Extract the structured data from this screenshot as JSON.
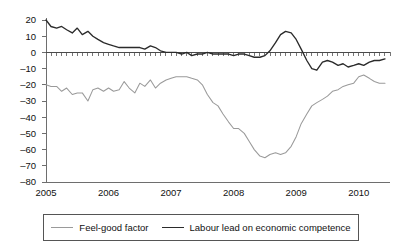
{
  "chart_data": {
    "type": "line",
    "title": "",
    "xlabel": "",
    "ylabel": "",
    "ylim": [
      -80,
      20
    ],
    "xlim": [
      2005.0,
      2010.5
    ],
    "grid": false,
    "legend_position": "bottom",
    "y_ticks": [
      20,
      10,
      0,
      -10,
      -20,
      -30,
      -40,
      -50,
      -60,
      -70,
      -80
    ],
    "y_tick_labels": [
      "20",
      "10",
      "0",
      "–10",
      "–20",
      "–30",
      "–40",
      "–50",
      "–60",
      "–70",
      "–80"
    ],
    "x_ticks": [
      2005,
      2006,
      2007,
      2008,
      2009,
      2010
    ],
    "x_tick_labels": [
      "2005",
      "2006",
      "2007",
      "2008",
      "2009",
      "2010"
    ],
    "minor_x_ticks_per_year": 12,
    "series": [
      {
        "name": "Feel-good factor",
        "color": "#9a9a9a",
        "x": [
          2005.0,
          2005.08,
          2005.17,
          2005.25,
          2005.33,
          2005.42,
          2005.5,
          2005.58,
          2005.67,
          2005.75,
          2005.83,
          2005.92,
          2006.0,
          2006.08,
          2006.17,
          2006.25,
          2006.33,
          2006.42,
          2006.5,
          2006.58,
          2006.67,
          2006.75,
          2006.83,
          2006.92,
          2007.0,
          2007.08,
          2007.17,
          2007.25,
          2007.33,
          2007.42,
          2007.5,
          2007.58,
          2007.67,
          2007.75,
          2007.83,
          2007.92,
          2008.0,
          2008.08,
          2008.17,
          2008.25,
          2008.33,
          2008.42,
          2008.5,
          2008.58,
          2008.67,
          2008.75,
          2008.83,
          2008.92,
          2009.0,
          2009.08,
          2009.17,
          2009.25,
          2009.33,
          2009.42,
          2009.5,
          2009.58,
          2009.67,
          2009.75,
          2009.83,
          2009.92,
          2010.0,
          2010.08,
          2010.17,
          2010.25,
          2010.33,
          2010.42
        ],
        "values": [
          -20,
          -21,
          -21,
          -24,
          -22,
          -26,
          -25,
          -25,
          -30,
          -23,
          -22,
          -24,
          -22,
          -24,
          -23,
          -18,
          -22,
          -25,
          -19,
          -21,
          -17,
          -22,
          -19,
          -17,
          -16,
          -15,
          -15,
          -15,
          -16,
          -17,
          -20,
          -26,
          -31,
          -33,
          -38,
          -43,
          -47,
          -47,
          -50,
          -55,
          -60,
          -64,
          -65,
          -63,
          -62,
          -63,
          -62,
          -58,
          -52,
          -44,
          -38,
          -33,
          -31,
          -29,
          -27,
          -24,
          -23,
          -21,
          -20,
          -19,
          -15,
          -14,
          -16,
          -18,
          -19,
          -19
        ]
      },
      {
        "name": "Labour lead on economic competence",
        "color": "#2b2b2b",
        "x": [
          2005.0,
          2005.08,
          2005.17,
          2005.25,
          2005.33,
          2005.42,
          2005.5,
          2005.58,
          2005.67,
          2005.75,
          2005.83,
          2005.92,
          2006.0,
          2006.08,
          2006.17,
          2006.25,
          2006.33,
          2006.42,
          2006.5,
          2006.58,
          2006.67,
          2006.75,
          2006.83,
          2006.92,
          2007.0,
          2007.08,
          2007.17,
          2007.25,
          2007.33,
          2007.42,
          2007.5,
          2007.58,
          2007.67,
          2007.75,
          2007.83,
          2007.92,
          2008.0,
          2008.08,
          2008.17,
          2008.25,
          2008.33,
          2008.42,
          2008.5,
          2008.58,
          2008.67,
          2008.75,
          2008.83,
          2008.92,
          2009.0,
          2009.08,
          2009.17,
          2009.25,
          2009.33,
          2009.42,
          2009.5,
          2009.58,
          2009.67,
          2009.75,
          2009.83,
          2009.92,
          2010.0,
          2010.08,
          2010.17,
          2010.25,
          2010.33,
          2010.42
        ],
        "values": [
          20,
          16,
          15,
          16,
          14,
          12,
          15,
          11,
          13,
          10,
          8,
          6,
          5,
          4,
          3,
          3,
          3,
          3,
          3,
          2,
          4,
          3,
          1,
          0,
          0,
          0,
          -1,
          0,
          -2,
          -1,
          -1,
          0,
          -1,
          -1,
          -1,
          -1,
          -2,
          -1,
          -1,
          -2,
          -3,
          -3,
          -2,
          1,
          6,
          11,
          13,
          12,
          8,
          2,
          -5,
          -10,
          -11,
          -6,
          -5,
          -6,
          -8,
          -7,
          -9,
          -8,
          -7,
          -8,
          -6,
          -5,
          -5,
          -4
        ]
      }
    ]
  },
  "legend": {
    "entries": [
      {
        "label": "Feel-good factor",
        "icon": "line-swatch-light"
      },
      {
        "label": "Labour lead on economic competence",
        "icon": "line-swatch-dark"
      }
    ]
  },
  "colors": {
    "light_series": "#9a9a9a",
    "dark_series": "#2b2b2b",
    "axis": "#6e6e6e",
    "background": "#ffffff"
  }
}
